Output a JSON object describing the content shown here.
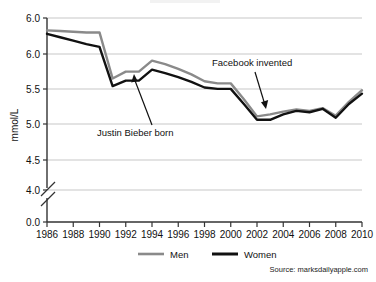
{
  "chart_data": {
    "type": "line",
    "title": "",
    "xlabel": "",
    "ylabel": "mmol/L",
    "x": [
      1986,
      1987,
      1988,
      1989,
      1990,
      1991,
      1992,
      1993,
      1994,
      1995,
      1996,
      1997,
      1998,
      1999,
      2000,
      2001,
      2002,
      2003,
      2004,
      2005,
      2006,
      2007,
      2008,
      2009,
      2010
    ],
    "xticks": [
      "1986",
      "1988",
      "1990",
      "1992",
      "1994",
      "1996",
      "1998",
      "2000",
      "2002",
      "2004",
      "2006",
      "2008",
      "2010"
    ],
    "yticks": [
      "6.0",
      "6.0",
      "5.5",
      "5.0",
      "4.5",
      "4.0",
      "0.0"
    ],
    "ylim": [
      4.0,
      6.5
    ],
    "y_axis_break": true,
    "grid": true,
    "legend_position": "bottom",
    "series": [
      {
        "name": "Men",
        "color": "#8a8a8a",
        "values": [
          6.32,
          6.31,
          6.3,
          6.29,
          6.29,
          5.62,
          5.72,
          5.72,
          5.88,
          5.83,
          5.76,
          5.68,
          5.58,
          5.55,
          5.55,
          5.32,
          5.07,
          5.1,
          5.14,
          5.17,
          5.15,
          5.19,
          5.08,
          5.28,
          5.45
        ]
      },
      {
        "name": "Women",
        "color": "#111111",
        "values": [
          6.27,
          6.22,
          6.17,
          6.12,
          6.08,
          5.51,
          5.59,
          5.59,
          5.75,
          5.7,
          5.64,
          5.57,
          5.49,
          5.47,
          5.47,
          5.25,
          5.02,
          5.02,
          5.1,
          5.15,
          5.13,
          5.18,
          5.05,
          5.25,
          5.4
        ]
      }
    ],
    "annotations": [
      {
        "text": "Justin Bieber born",
        "x": 1994,
        "note": "arrow points up to ~1994 peak"
      },
      {
        "text": "Facebook invented",
        "x": 2004,
        "note": "arrow points down to ~2003"
      }
    ]
  },
  "legend": {
    "men_label": "Men",
    "women_label": "Women"
  },
  "footer": {
    "source": "Source: marksdailyapple.com"
  },
  "axis": {
    "y_title": "mmol/L"
  }
}
